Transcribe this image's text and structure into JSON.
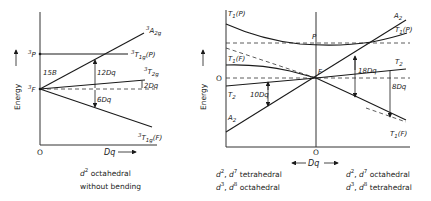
{
  "left_panel": {
    "y_axis_label": "Energy",
    "x_axis_label": "Dq",
    "origin": "O",
    "levels": {
      "p": "3P",
      "f": "3F"
    },
    "terms": {
      "a2g": "3A2g",
      "t1g_p": "3T1g(P)",
      "t2g": "3T2g",
      "t1g_f": "3T1g(F)"
    },
    "gaps": {
      "b": "15B",
      "dq12": "12Dq",
      "dq2": "2Dq",
      "dq6": "6Dq"
    },
    "caption_line1": "d2 octahedral",
    "caption_line2": "without bending"
  },
  "right_panel": {
    "y_axis_label": "Energy",
    "x_axis_label": "Dq",
    "zero_label": "O",
    "origin": "O",
    "center_labels": {
      "p": "P",
      "f": "F"
    },
    "left_terms": {
      "t1p": "T1(P)",
      "t1f": "T1(F)",
      "t2": "T2",
      "a2": "A2"
    },
    "right_terms": {
      "a2": "A2",
      "t1p": "T1(P)",
      "t2": "T2",
      "t1f": "T1(F)"
    },
    "gaps": {
      "dq10": "10Dq",
      "dq18": "18Dq",
      "dq8": "8Dq"
    },
    "caption_left_line1": "d2, d7 tetrahedral",
    "caption_left_line2": "d3, d8 octahedral",
    "caption_right_line1": "d2, d7 octahedral",
    "caption_right_line2": "d3, d8 tetrahedral"
  }
}
